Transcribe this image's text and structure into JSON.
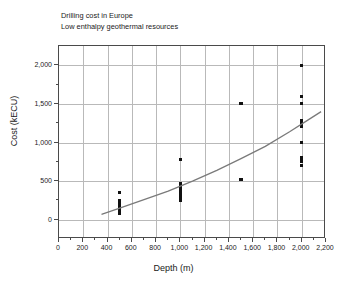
{
  "chart_data": {
    "type": "scatter",
    "title": "Drilling cost in Europe",
    "subtitle": "Low enthalpy geothermal resources",
    "xlabel": "Depth  (m)",
    "ylabel": "Cost (kECU)",
    "xlim": [
      0,
      2200
    ],
    "ylim": [
      -250,
      2250
    ],
    "grid": true,
    "legend": false,
    "xticks": [
      0,
      200,
      400,
      600,
      800,
      1000,
      1200,
      1400,
      1600,
      1800,
      2000,
      2200
    ],
    "xticklabels": [
      "0",
      "200",
      "400",
      "600",
      "800",
      "1,000",
      "1,200",
      "1,400",
      "1,600",
      "1,800",
      "2,000",
      "2,200"
    ],
    "yticks": [
      0,
      500,
      1000,
      1500,
      2000
    ],
    "yticklabels": [
      "0",
      "500",
      "1,000",
      "1,500",
      "2,000"
    ],
    "yminorticks": [
      -250,
      250,
      750,
      1250,
      1750,
      2250
    ],
    "marker": "square",
    "marker_color": "#111111",
    "points": [
      {
        "x": 500,
        "y": 355
      },
      {
        "x": 500,
        "y": 250
      },
      {
        "x": 500,
        "y": 230
      },
      {
        "x": 500,
        "y": 210
      },
      {
        "x": 500,
        "y": 190
      },
      {
        "x": 500,
        "y": 170
      },
      {
        "x": 500,
        "y": 150
      },
      {
        "x": 500,
        "y": 130
      },
      {
        "x": 500,
        "y": 110
      },
      {
        "x": 500,
        "y": 90
      },
      {
        "x": 500,
        "y": 75
      },
      {
        "x": 1000,
        "y": 775
      },
      {
        "x": 1000,
        "y": 470
      },
      {
        "x": 1000,
        "y": 450
      },
      {
        "x": 1000,
        "y": 430
      },
      {
        "x": 1000,
        "y": 410
      },
      {
        "x": 1000,
        "y": 390
      },
      {
        "x": 1000,
        "y": 370
      },
      {
        "x": 1000,
        "y": 350
      },
      {
        "x": 1000,
        "y": 330
      },
      {
        "x": 1000,
        "y": 310
      },
      {
        "x": 1000,
        "y": 290
      },
      {
        "x": 1000,
        "y": 270
      },
      {
        "x": 1000,
        "y": 250
      },
      {
        "x": 1500,
        "y": 1500
      },
      {
        "x": 1500,
        "y": 520
      },
      {
        "x": 2000,
        "y": 2000
      },
      {
        "x": 2000,
        "y": 1600
      },
      {
        "x": 2000,
        "y": 1500
      },
      {
        "x": 2000,
        "y": 1290
      },
      {
        "x": 2000,
        "y": 1270
      },
      {
        "x": 2000,
        "y": 1250
      },
      {
        "x": 2000,
        "y": 1230
      },
      {
        "x": 2000,
        "y": 1210
      },
      {
        "x": 2000,
        "y": 1000
      },
      {
        "x": 2000,
        "y": 800
      },
      {
        "x": 2000,
        "y": 760
      },
      {
        "x": 2000,
        "y": 705
      }
    ],
    "trend": {
      "name": "fitted trend curve",
      "color": "#7a7a7a",
      "x": [
        350,
        500,
        700,
        900,
        1100,
        1300,
        1500,
        1700,
        1900,
        2050,
        2160
      ],
      "y": [
        70,
        150,
        260,
        370,
        500,
        640,
        790,
        950,
        1140,
        1290,
        1400
      ]
    }
  }
}
